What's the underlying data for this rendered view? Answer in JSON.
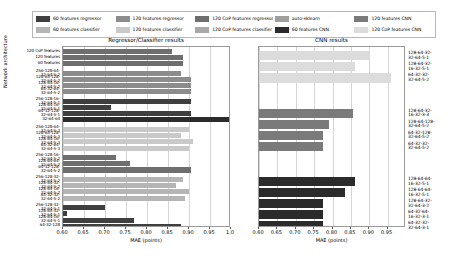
{
  "legend": {
    "items": [
      {
        "label": "60 features regressor",
        "color": "#3f3f3f"
      },
      {
        "label": "120 features regressor",
        "color": "#8c8c8c"
      },
      {
        "label": "120 CoP features regressor",
        "color": "#6e6e6e"
      },
      {
        "label": "auto-sklearn",
        "color": "#9e9e9e"
      },
      {
        "label": "120 features CNN",
        "color": "#7a7a7a"
      },
      {
        "label": "60 features classifier",
        "color": "#b5b5b5"
      },
      {
        "label": "120 features classifier",
        "color": "#c9c9c9"
      },
      {
        "label": "120 CoP features classifier",
        "color": "#a8a8a8"
      },
      {
        "label": "60 features CNN",
        "color": "#2b2b2b"
      },
      {
        "label": "120 CoP features CNN",
        "color": "#dcdcdc"
      }
    ]
  },
  "chart_data": [
    {
      "type": "bar",
      "title": "Regressor/Classifier results",
      "xlabel": "MAE (points)",
      "ylabel": "Network architecture",
      "xlim": [
        0.6,
        1.0
      ],
      "xticks": [
        0.6,
        0.65,
        0.7,
        0.75,
        0.8,
        0.85,
        0.9,
        0.95,
        1.0
      ],
      "xticklabels": [
        "0.60",
        "0.65",
        "0.70",
        "0.75",
        "0.80",
        "0.85",
        "0.90",
        "0.95",
        "1.0"
      ],
      "grid": true,
      "legend_position": "above-figure",
      "bars": [
        {
          "label": "120 CoP features",
          "value": 0.86,
          "color": "#6e6e6e",
          "series": "120 CoP features regressor"
        },
        {
          "label": "120 features",
          "value": 0.885,
          "color": "#6e6e6e",
          "series": "120 CoP features regressor"
        },
        {
          "label": "60 features",
          "value": 0.885,
          "color": "#6e6e6e",
          "series": "120 CoP features regressor"
        },
        {
          "label": "256-128-64-\n32-64-5-2",
          "value": 0.88,
          "color": "#8c8c8c",
          "series": "120 features regressor"
        },
        {
          "label": "128-64-128-\n32-64-5-2",
          "value": 0.905,
          "color": "#8c8c8c",
          "series": "120 features regressor"
        },
        {
          "label": "128-64-16-\n32-64-5-2",
          "value": 0.905,
          "color": "#8c8c8c",
          "series": "120 features regressor"
        },
        {
          "label": "64-32-64-\n32-64-5-2",
          "value": 0.905,
          "color": "#8c8c8c",
          "series": "120 features regressor"
        },
        {
          "label": "256-128-16-\n32-64-5-1",
          "value": 0.905,
          "color": "#3f3f3f",
          "series": "60 features regressor"
        },
        {
          "label": "128-64-16-\n32-64-5-1",
          "value": 0.715,
          "color": "#3f3f3f",
          "series": "60 features regressor"
        },
        {
          "label": "64-32-128-\n32-64-5-1",
          "value": 0.905,
          "color": "#3f3f3f",
          "series": "60 features regressor"
        },
        {
          "label": "32-64-64",
          "value": 0.995,
          "color": "#2b2b2b",
          "series": "auto-sklearn"
        },
        {
          "label": "256-128-64-\n32-64-5-3",
          "value": 0.9,
          "color": "#c9c9c9",
          "series": "120 features classifier"
        },
        {
          "label": "128-64-128-\n32-64-5-3",
          "value": 0.88,
          "color": "#c9c9c9",
          "series": "120 features classifier"
        },
        {
          "label": "128-64-16-\n32-64-5-3",
          "value": 0.91,
          "color": "#c9c9c9",
          "series": "120 features classifier"
        },
        {
          "label": "64-32-64-\n32-64-5-3",
          "value": 0.9,
          "color": "#c9c9c9",
          "series": "120 features classifier"
        },
        {
          "label": "256-128-16-\n32-64-5-2",
          "value": 0.725,
          "color": "#6e6e6e",
          "series": "120 CoP features classifier"
        },
        {
          "label": "128-64-64-\n32-64-5-2",
          "value": 0.76,
          "color": "#6e6e6e",
          "series": "120 CoP features classifier"
        },
        {
          "label": "64-32-128-\n32-64-5-2",
          "value": 0.905,
          "color": "#6e6e6e",
          "series": "120 CoP features classifier"
        },
        {
          "label": "256-128-32-\n32-64-5-2",
          "value": 0.885,
          "color": "#b5b5b5",
          "series": "60 features classifier"
        },
        {
          "label": "128-64-32-\n32-64-5-2",
          "value": 0.87,
          "color": "#b5b5b5",
          "series": "60 features classifier"
        },
        {
          "label": "128-64-16-\n32-64-5-2",
          "value": 0.9,
          "color": "#b5b5b5",
          "series": "60 features classifier"
        },
        {
          "label": "64-32-32-\n32-64-5-2",
          "value": 0.89,
          "color": "#b5b5b5",
          "series": "60 features classifier"
        },
        {
          "label": "256-128-32-\n32-64-5-1",
          "value": 0.7,
          "color": "#3f3f3f",
          "series": "60 features regressor"
        },
        {
          "label": "128-64-32-\n32-64-5-1",
          "value": 0.61,
          "color": "#3f3f3f",
          "series": "60 features regressor"
        },
        {
          "label": "128-64-16-\n32-64-5-1",
          "value": 0.77,
          "color": "#3f3f3f",
          "series": "60 features regressor"
        },
        {
          "label": "64-32-128",
          "value": 0.88,
          "color": "#3f3f3f",
          "series": "60 features regressor"
        }
      ]
    },
    {
      "type": "bar",
      "title": "CNN results",
      "xlabel": "MAE (points)",
      "ylabel": "",
      "xlim": [
        0.6,
        1.0
      ],
      "xticks": [
        0.6,
        0.65,
        0.7,
        0.75,
        0.8,
        0.85,
        0.9,
        0.95
      ],
      "xticklabels": [
        "0.60",
        "0.65",
        "0.70",
        "0.75",
        "0.80",
        "0.85",
        "0.90",
        "0.95"
      ],
      "grid": true,
      "bars": [
        {
          "label": "128-64-32-\n32-64-5-1",
          "value": 0.9,
          "color": "#dcdcdc",
          "series": "120 CoP features CNN"
        },
        {
          "label": "128-64-32-\n16-32-5-1",
          "value": 0.86,
          "color": "#dcdcdc",
          "series": "120 CoP features CNN"
        },
        {
          "label": "64-32-32-\n32-64-5-2",
          "value": 0.96,
          "color": "#dcdcdc",
          "series": "120 CoP features CNN"
        },
        {
          "label": "128-64-32-\n16-32-3-3",
          "value": 0.855,
          "color": "#7a7a7a",
          "series": "120 features CNN"
        },
        {
          "label": "128-64-128-\n32-64-5-2",
          "value": 0.79,
          "color": "#7a7a7a",
          "series": "120 features CNN"
        },
        {
          "label": "64-32-128-\n32-64-5-2",
          "value": 0.775,
          "color": "#7a7a7a",
          "series": "120 features CNN"
        },
        {
          "label": "64-32-32-\n32-64-5-2",
          "value": 0.775,
          "color": "#7a7a7a",
          "series": "120 features CNN"
        },
        {
          "label": "128-64-64-\n16-32-5-1",
          "value": 0.86,
          "color": "#2b2b2b",
          "series": "60 features CNN"
        },
        {
          "label": "128-64-64-\n16-32-5-1",
          "value": 0.835,
          "color": "#2b2b2b",
          "series": "60 features CNN"
        },
        {
          "label": "128-64-32-\n32-64-3-2",
          "value": 0.775,
          "color": "#2b2b2b",
          "series": "60 features CNN"
        },
        {
          "label": "64-32-64-\n16-32-3-1",
          "value": 0.775,
          "color": "#2b2b2b",
          "series": "60 features CNN"
        },
        {
          "label": "64-32-32-\n32-64-3-1",
          "value": 0.775,
          "color": "#2b2b2b",
          "series": "60 features CNN"
        }
      ]
    }
  ]
}
